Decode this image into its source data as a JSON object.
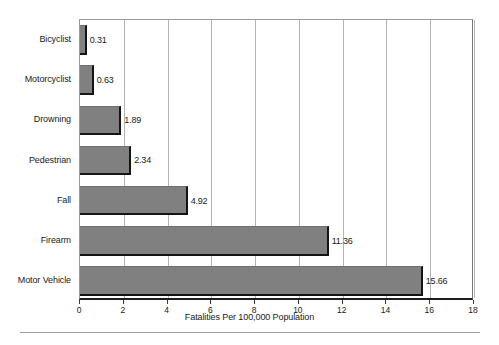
{
  "chart_data": {
    "type": "bar",
    "orientation": "horizontal",
    "title": "",
    "xlabel": "Fatalities Per 100,000 Population",
    "ylabel": "",
    "xlim": [
      0,
      18
    ],
    "xticks": [
      "0",
      "2",
      "4",
      "6",
      "8",
      "10",
      "12",
      "14",
      "16",
      "18"
    ],
    "xtick_values": [
      0,
      2,
      4,
      6,
      8,
      10,
      12,
      14,
      16,
      18
    ],
    "grid": "vertical",
    "legend": "none",
    "bar_color": "#808080",
    "bar_shadow_color": "#141414",
    "gridline_color": "#b4b4b4",
    "categories": [
      "Bicyclist",
      "Motorcyclist",
      "Drowning",
      "Pedestrian",
      "Fall",
      "Firearm",
      "Motor Vehicle"
    ],
    "values": [
      0.31,
      0.63,
      1.89,
      2.34,
      4.92,
      11.36,
      15.66
    ],
    "value_labels": [
      "0.31",
      "0.63",
      "1.89",
      "2.34",
      "4.92",
      "11.36",
      "15.66"
    ]
  }
}
